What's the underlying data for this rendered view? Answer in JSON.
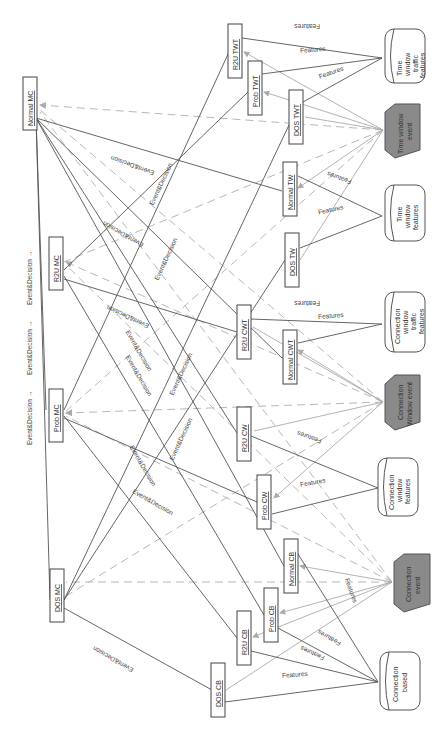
{
  "diagram": {
    "orientation": "rotated 90 degrees clockwise",
    "legend_flow": [
      "Event&Decision",
      "Event&Decision",
      "Event&Decision"
    ],
    "sources": [
      {
        "id": "twt_src",
        "label": [
          "Time",
          "window",
          "traffic",
          "features"
        ],
        "shape": "cylinder",
        "x": 407,
        "y": 56
      },
      {
        "id": "tw_event",
        "label": [
          "Time window",
          "event"
        ],
        "shape": "hexagon",
        "x": 407,
        "y": 130
      },
      {
        "id": "tw_src",
        "label": [
          "Time",
          "window",
          "features"
        ],
        "shape": "cylinder",
        "x": 407,
        "y": 210
      },
      {
        "id": "cwt_src",
        "label": [
          "Connection",
          "window",
          "traffic",
          "features"
        ],
        "shape": "cylinder",
        "x": 407,
        "y": 320
      },
      {
        "id": "cw_event",
        "label": [
          "Connection",
          "Window event"
        ],
        "shape": "hexagon",
        "x": 407,
        "y": 402
      },
      {
        "id": "cw_src",
        "label": [
          "Connection",
          "window",
          "features"
        ],
        "shape": "cylinder",
        "x": 400,
        "y": 488
      },
      {
        "id": "c_event",
        "label": [
          "Connection",
          "event"
        ],
        "shape": "hexagon",
        "x": 412,
        "y": 582
      },
      {
        "id": "cb_src",
        "label": [
          "Connection",
          "based"
        ],
        "shape": "cylinder",
        "x": 400,
        "y": 680
      }
    ],
    "classifiers": [
      {
        "id": "r2u_twt",
        "label": "R2U TWT",
        "x": 235,
        "y": 51
      },
      {
        "id": "prob_twt",
        "label": "Prob TWT",
        "x": 255,
        "y": 89
      },
      {
        "id": "dos_twt",
        "label": "DOS TWT",
        "x": 296,
        "y": 117
      },
      {
        "id": "normal_tw",
        "label": "Normal TW",
        "x": 289,
        "y": 189
      },
      {
        "id": "dos_tw",
        "label": "DOS TW",
        "x": 292,
        "y": 260
      },
      {
        "id": "r2u_cwt",
        "label": "R2U CWT",
        "x": 243,
        "y": 332
      },
      {
        "id": "normal_cwt",
        "label": "Normal CWT",
        "x": 289,
        "y": 355
      },
      {
        "id": "r2u_cw",
        "label": "R2U CW",
        "x": 244,
        "y": 433
      },
      {
        "id": "prob_cw",
        "label": "Prob CW",
        "x": 264,
        "y": 502
      },
      {
        "id": "normal_cb",
        "label": "Normal CB",
        "x": 291,
        "y": 566
      },
      {
        "id": "prob_cb",
        "label": "Prob CB",
        "x": 271,
        "y": 615
      },
      {
        "id": "r2u_cb",
        "label": "R2U CB",
        "x": 244,
        "y": 638
      },
      {
        "id": "dos_cb",
        "label": "DOS CB",
        "x": 218,
        "y": 690
      }
    ],
    "meta_classifiers": [
      {
        "id": "normal_mc",
        "label": "Normal MC",
        "x": 29,
        "y": 104
      },
      {
        "id": "r2u_mc",
        "label": "R2U MC",
        "x": 56,
        "y": 264
      },
      {
        "id": "prob_mc",
        "label": "Prob MC",
        "x": 56,
        "y": 413
      },
      {
        "id": "dos_mc",
        "label": "DOS MC",
        "x": 57,
        "y": 596
      }
    ],
    "edge_labels": {
      "features": "Features",
      "event_decision": "Event&Decision"
    },
    "colors": {
      "line": "#555555",
      "event_line": "#a8a8a8",
      "dashed": "#b5b5b5",
      "hex_fill": "#8a8a8a",
      "box_border": "#444444"
    }
  }
}
